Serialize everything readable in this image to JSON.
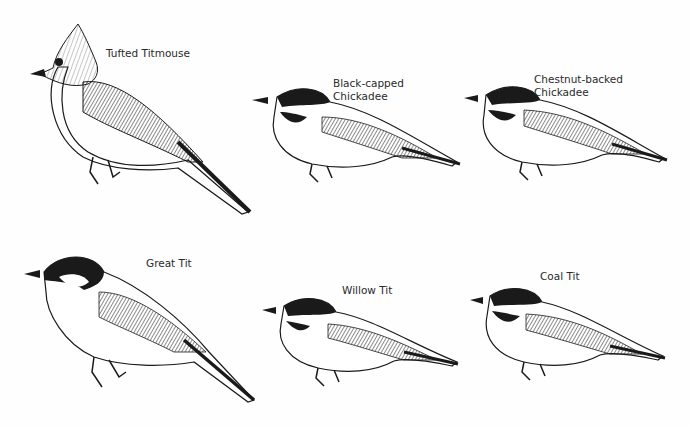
{
  "plate": {
    "description": "Illustration plate of titmice and chickadees",
    "birds": [
      {
        "id": "tufted-titmouse",
        "label_lines": [
          "Tufted Titmouse"
        ]
      },
      {
        "id": "black-capped-chickadee",
        "label_lines": [
          "Black-capped",
          "Chickadee"
        ]
      },
      {
        "id": "chestnut-backed-chickadee",
        "label_lines": [
          "Chestnut-backed",
          "Chickadee"
        ]
      },
      {
        "id": "great-tit",
        "label_lines": [
          "Great Tit"
        ]
      },
      {
        "id": "willow-tit",
        "label_lines": [
          "Willow Tit"
        ]
      },
      {
        "id": "coal-tit",
        "label_lines": [
          "Coal Tit"
        ]
      }
    ]
  },
  "colors": {
    "ink": "#1a1a1a",
    "paper": "#fefefe",
    "label": "#2a2a2a"
  }
}
